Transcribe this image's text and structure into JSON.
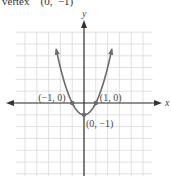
{
  "header": {
    "text": "vertex    (0,  −1)"
  },
  "chart_data": {
    "type": "line",
    "title": "",
    "equation": "y = x^2 - 1",
    "xlabel": "x",
    "ylabel": "y",
    "xlim": [
      -5.8,
      5.8
    ],
    "ylim": [
      -6,
      6
    ],
    "grid": true,
    "grid_step": 1,
    "series": [
      {
        "name": "y = x^2 - 1",
        "x": [
          -2.35,
          -2,
          -1.5,
          -1,
          -0.5,
          0,
          0.5,
          1,
          1.5,
          2,
          2.35
        ],
        "y": [
          4.52,
          3,
          1.25,
          0,
          -0.75,
          -1,
          -0.75,
          0,
          1.25,
          3,
          4.52
        ]
      }
    ],
    "points": [
      {
        "label": "(−1, 0)",
        "x": -1,
        "y": 0
      },
      {
        "label": "(1, 0)",
        "x": 1,
        "y": 0
      },
      {
        "label": "(0, −1)",
        "x": 0,
        "y": -1
      }
    ]
  },
  "colors": {
    "curve": "#6a6a6a",
    "axis": "#333333",
    "grid": "#d9d9d9",
    "text": "#444444"
  }
}
